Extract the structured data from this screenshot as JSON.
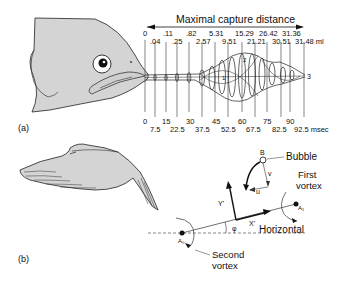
{
  "panel_a": {
    "label": "(a)",
    "axis_title": "Maximal capture distance",
    "volume_unit": "ml",
    "time_unit": "msec",
    "volume_top_row": [
      "0",
      ".11",
      ".82",
      "5.31",
      "15.29",
      "26.42",
      "31.36"
    ],
    "volume_second_row": [
      ".04",
      ".25",
      "2.57",
      "9.51",
      "21.21",
      "30.51",
      "31.48 ml"
    ],
    "time_top_row": [
      "0",
      "15",
      "30",
      "45",
      "60",
      "75",
      "90"
    ],
    "time_bottom_row": [
      "7.5",
      "22.5",
      "37.5",
      "52.5",
      "67.5",
      "82.5",
      "92.5 msec"
    ],
    "marker_labels": [
      "1",
      "2",
      "3"
    ]
  },
  "panel_b": {
    "label": "(b)",
    "bubble_label": "Bubble",
    "bubble_point": "B",
    "velocity_v": "v",
    "velocity_u": "u",
    "first_vortex_line1": "First",
    "first_vortex_line2": "vortex",
    "second_vortex_line1": "Second",
    "second_vortex_line2": "vortex",
    "horizontal_label": "Horizontal",
    "axis_x": "X'",
    "axis_y": "Y'",
    "angle": "φ",
    "point_a1": "A₁",
    "point_a0": "A₀"
  },
  "colors": {
    "fill_gray": "#d4d4d4",
    "ink": "#111111",
    "background": "#ffffff"
  }
}
